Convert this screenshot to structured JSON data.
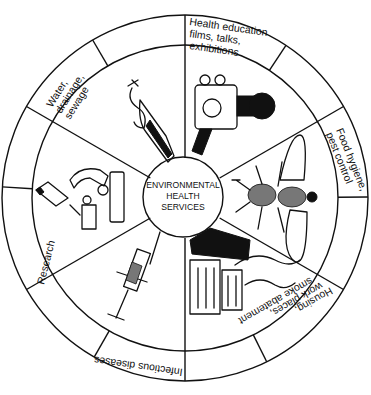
{
  "diagram": {
    "center_label": [
      "ENVIRONMENTAL",
      "HEALTH",
      "SERVICES"
    ],
    "sectors": [
      {
        "id": "health-education",
        "label_lines": [
          "Health education",
          "films, talks,",
          "exhibitions"
        ],
        "icon": "movie-camera-icon"
      },
      {
        "id": "food-hygiene",
        "label_lines": [
          "Food hygiene,",
          "pest control"
        ],
        "icon": "fly-icon"
      },
      {
        "id": "housing",
        "label_lines": [
          "Housing,",
          "work places,",
          "smoke abatement"
        ],
        "icon": "houses-smoke-icon"
      },
      {
        "id": "infectious-diseases",
        "label_lines": [
          "Infectious diseases"
        ],
        "icon": "syringe-icon"
      },
      {
        "id": "research",
        "label_lines": [
          "Research"
        ],
        "icon": "microscope-icon"
      },
      {
        "id": "water",
        "label_lines": [
          "Water,",
          "drainage,",
          "sewage"
        ],
        "icon": "water-tap-icon"
      }
    ],
    "colors": {
      "ink": "#111111",
      "paper": "#ffffff"
    }
  }
}
